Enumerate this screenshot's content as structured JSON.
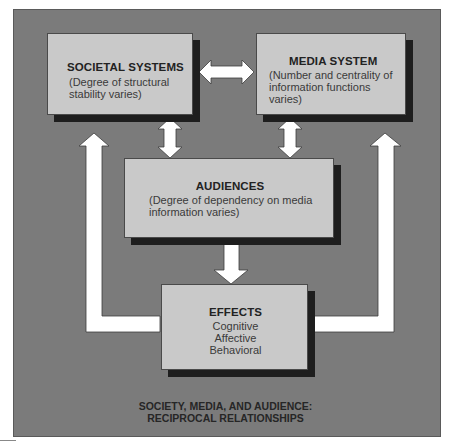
{
  "diagram": {
    "title_line1": "SOCIETY, MEDIA, AND AUDIENCE:",
    "title_line2": "RECIPROCAL RELATIONSHIPS",
    "colors": {
      "panel": "#7b7b7b",
      "box": "#c9c9c9",
      "shadow": "#1e1e1e",
      "arrow": "#ffffff"
    },
    "nodes": {
      "societal": {
        "title": "SOCIETAL SYSTEMS",
        "desc_line1": "(Degree of structural",
        "desc_line2": "stability varies)"
      },
      "media": {
        "title": "MEDIA SYSTEM",
        "desc_line1": "(Number and centrality of",
        "desc_line2": "information functions",
        "desc_line3": "varies)"
      },
      "audiences": {
        "title": "AUDIENCES",
        "desc_line1": "(Degree of dependency on media",
        "desc_line2": "information varies)"
      },
      "effects": {
        "title": "EFFECTS",
        "item1": "Cognitive",
        "item2": "Affective",
        "item3": "Behavioral"
      }
    },
    "edges": [
      {
        "from": "societal",
        "to": "media",
        "type": "bidirectional"
      },
      {
        "from": "societal",
        "to": "audiences",
        "type": "bidirectional"
      },
      {
        "from": "media",
        "to": "audiences",
        "type": "bidirectional"
      },
      {
        "from": "audiences",
        "to": "effects",
        "type": "directed"
      },
      {
        "from": "effects",
        "to": "societal",
        "type": "directed",
        "route": "left-feedback"
      },
      {
        "from": "effects",
        "to": "media",
        "type": "directed",
        "route": "right-feedback"
      }
    ]
  }
}
